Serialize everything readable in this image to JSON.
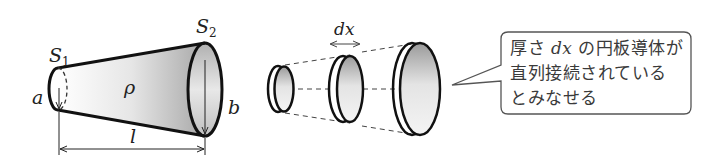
{
  "labels": {
    "s1_main": "S",
    "s1_sub": "1",
    "s2_main": "S",
    "s2_sub": "2",
    "a": "a",
    "b": "b",
    "rho": "ρ",
    "l": "l",
    "dx": "dx"
  },
  "callout": {
    "line1_prefix": "厚さ ",
    "line1_var": "dx",
    "line1_suffix": " の円板導体が",
    "line2": "直列接続されている",
    "line3": "とみなせる"
  },
  "colors": {
    "stroke": "#111111",
    "shade_dark": "#9a9a9a",
    "shade_light": "#f2f2f2",
    "callout_border": "#555555"
  }
}
